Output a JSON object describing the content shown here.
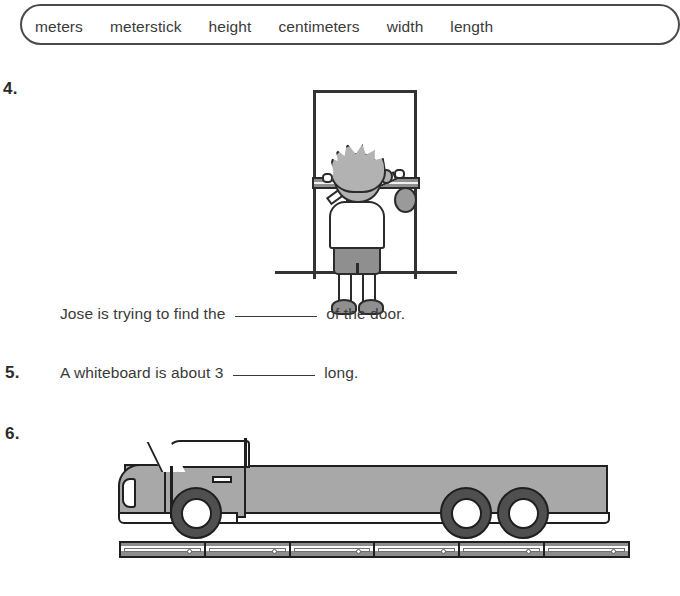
{
  "word_bank": {
    "words": [
      "meters",
      "meterstick",
      "height",
      "centimeters",
      "width",
      "length"
    ]
  },
  "items": [
    {
      "number": "4.",
      "text_before": "Jose is trying to find the",
      "blank": "",
      "text_after": "of the door.",
      "illustration": "boy-measuring-door-with-meterstick"
    },
    {
      "number": "5.",
      "text_before": "A whiteboard is about 3",
      "blank": "",
      "text_after": "long.",
      "illustration": ""
    },
    {
      "number": "6.",
      "text_before": "",
      "blank": "",
      "text_after": "",
      "illustration": "flatbed-truck-above-six-metersticks"
    }
  ],
  "truck": {
    "meterstick_count": 6,
    "wheel_count": 3
  },
  "colors": {
    "ink": "#2e2e2e",
    "outline": "#1f1f1f",
    "body_gray": "#a8a8a8",
    "tire_gray": "#4f4f4f",
    "stick_gray": "#8d8d8d",
    "page": "#ffffff"
  }
}
